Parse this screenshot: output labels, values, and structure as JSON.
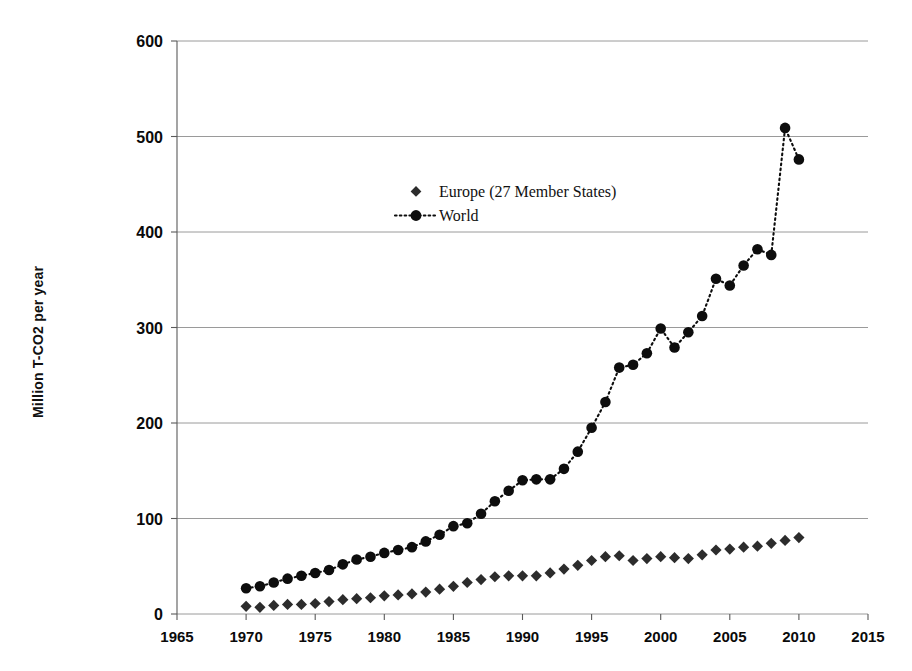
{
  "chart_data": {
    "type": "line",
    "title": "",
    "subtitle": "",
    "xlabel": "",
    "ylabel": "Million T-CO2  per year",
    "xlim": [
      1965,
      2015
    ],
    "ylim": [
      0,
      600
    ],
    "xticks": [
      1965,
      1970,
      1975,
      1980,
      1985,
      1990,
      1995,
      2000,
      2005,
      2010,
      2015
    ],
    "yticks": [
      0,
      100,
      200,
      300,
      400,
      500,
      600
    ],
    "xtick_labels": [
      "1965",
      "1970",
      "1975",
      "1980",
      "1985",
      "1990",
      "1995",
      "2000",
      "2005",
      "2010",
      "2015"
    ],
    "ytick_labels": [
      "0",
      "100",
      "200",
      "300",
      "400",
      "500",
      "600"
    ],
    "grid": true,
    "grid_axis": "y",
    "legend_position": "center-upper",
    "x": [
      1970,
      1971,
      1972,
      1973,
      1974,
      1975,
      1976,
      1977,
      1978,
      1979,
      1980,
      1981,
      1982,
      1983,
      1984,
      1985,
      1986,
      1987,
      1988,
      1989,
      1990,
      1991,
      1992,
      1993,
      1994,
      1995,
      1996,
      1997,
      1998,
      1999,
      2000,
      2001,
      2002,
      2003,
      2004,
      2005,
      2006,
      2007,
      2008,
      2009,
      2010
    ],
    "series": [
      {
        "name": "Europe (27 Member States)",
        "marker": "diamond",
        "line_style": "none",
        "color": "#2c2c2c",
        "values": [
          8,
          7,
          9,
          10,
          10,
          11,
          13,
          15,
          16,
          17,
          19,
          20,
          21,
          23,
          26,
          29,
          33,
          36,
          39,
          40,
          40,
          40,
          43,
          47,
          51,
          56,
          60,
          61,
          56,
          58,
          60,
          59,
          58,
          62,
          67,
          68,
          70,
          71,
          74,
          77,
          80
        ]
      },
      {
        "name": "World",
        "marker": "circle",
        "line_style": "dotted",
        "color": "#0d0d0d",
        "values": [
          27,
          29,
          33,
          37,
          40,
          43,
          46,
          52,
          57,
          60,
          64,
          67,
          70,
          76,
          83,
          92,
          95,
          105,
          118,
          129,
          140,
          141,
          141,
          152,
          170,
          195,
          222,
          258,
          261,
          273,
          299,
          279,
          295,
          312,
          351,
          344,
          365,
          382,
          376,
          509,
          476
        ]
      }
    ],
    "annotations": [
      {
        "text": "peak",
        "x": 2009,
        "y": 509
      },
      {
        "text": "final",
        "x": 2010,
        "y": 476
      }
    ]
  },
  "legend": {
    "items": [
      {
        "label": "Europe (27 Member States)",
        "marker": "diamond-marker"
      },
      {
        "label": "World",
        "marker": "circle-dotted-marker"
      }
    ]
  },
  "axes": {
    "y_title": "Million T-CO2  per year"
  }
}
